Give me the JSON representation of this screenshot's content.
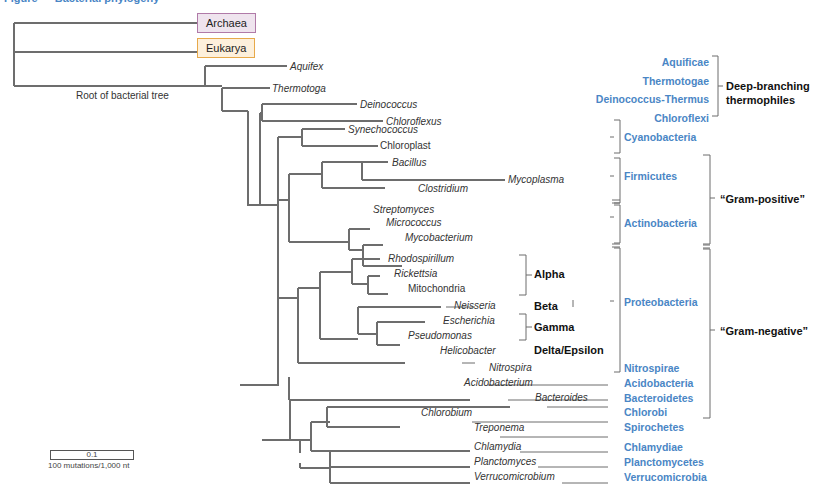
{
  "figure": {
    "title_partial": "Figure — Bacterial phylogeny",
    "root_label": "Root of bacterial tree",
    "outgroups": [
      "Archaea",
      "Eukarya"
    ],
    "scale_bar": {
      "value": "0.1",
      "caption": "100 mutations/1,000 nt"
    }
  },
  "taxa": [
    {
      "name": "Aquifex",
      "italic": true
    },
    {
      "name": "Thermotoga",
      "italic": true
    },
    {
      "name": "Deinococcus",
      "italic": true
    },
    {
      "name": "Chloroflexus",
      "italic": true
    },
    {
      "name": "Synechococcus",
      "italic": true
    },
    {
      "name": "Chloroplast",
      "italic": false
    },
    {
      "name": "Bacillus",
      "italic": true
    },
    {
      "name": "Mycoplasma",
      "italic": true
    },
    {
      "name": "Clostridium",
      "italic": true
    },
    {
      "name": "Streptomyces",
      "italic": true
    },
    {
      "name": "Micrococcus",
      "italic": true
    },
    {
      "name": "Mycobacterium",
      "italic": true
    },
    {
      "name": "Rhodospirillum",
      "italic": true
    },
    {
      "name": "Rickettsia",
      "italic": true
    },
    {
      "name": "Mitochondria",
      "italic": false
    },
    {
      "name": "Neisseria",
      "italic": true
    },
    {
      "name": "Escherichia",
      "italic": true
    },
    {
      "name": "Pseudomonas",
      "italic": true
    },
    {
      "name": "Helicobacter",
      "italic": true
    },
    {
      "name": "Nitrospira",
      "italic": true
    },
    {
      "name": "Acidobacterium",
      "italic": true
    },
    {
      "name": "Bacteroides",
      "italic": true
    },
    {
      "name": "Chlorobium",
      "italic": true
    },
    {
      "name": "Treponema",
      "italic": true
    },
    {
      "name": "Chlamydia",
      "italic": true
    },
    {
      "name": "Planctomyces",
      "italic": true
    },
    {
      "name": "Verrucomicrobium",
      "italic": true
    }
  ],
  "proteobacteria_subgroups": [
    "Alpha",
    "Beta",
    "Gamma",
    "Delta/Epsilon"
  ],
  "phyla": [
    "Aquificae",
    "Thermotogae",
    "Deinococcus-Thermus",
    "Chloroflexi",
    "Cyanobacteria",
    "Firmicutes",
    "Actinobacteria",
    "Proteobacteria",
    "Nitrospirae",
    "Acidobacteria",
    "Bacteroidetes",
    "Chlorobi",
    "Spirochetes",
    "Chlamydiae",
    "Planctomycetes",
    "Verrucomicrobia"
  ],
  "supergroups": {
    "thermophiles": "Deep-branching thermophiles",
    "gram_positive": "“Gram-positive”",
    "gram_negative": "“Gram-negative”"
  },
  "colors": {
    "phylum": "#4a86c5",
    "branch": "#6d6d6d",
    "archaea_fill": "#efe4ee",
    "eukarya_fill": "#fdf0dc"
  }
}
